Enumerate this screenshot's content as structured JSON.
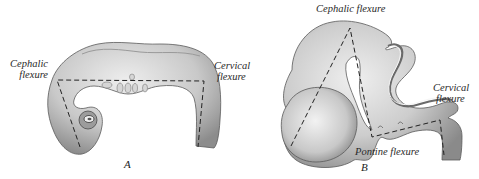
{
  "figure": {
    "panels": [
      {
        "id": "A",
        "letter": "A",
        "labels": {
          "cephalic": [
            "Cephalic",
            "flexure"
          ],
          "cervical": [
            "Cervical",
            "flexure"
          ]
        }
      },
      {
        "id": "B",
        "letter": "B",
        "labels": {
          "cephalic": "Cephalic flexure",
          "cervical": [
            "Cervical",
            "flexure"
          ],
          "pontine": "Pontine flexure"
        }
      }
    ],
    "colors": {
      "background": "#ffffff",
      "tissue_light": "#dcdcdc",
      "tissue_mid": "#b5b5b5",
      "tissue_dark": "#6e6e6e",
      "outline": "#4a4a4a",
      "dash": "#222222",
      "text": "#2a2a2a"
    }
  }
}
